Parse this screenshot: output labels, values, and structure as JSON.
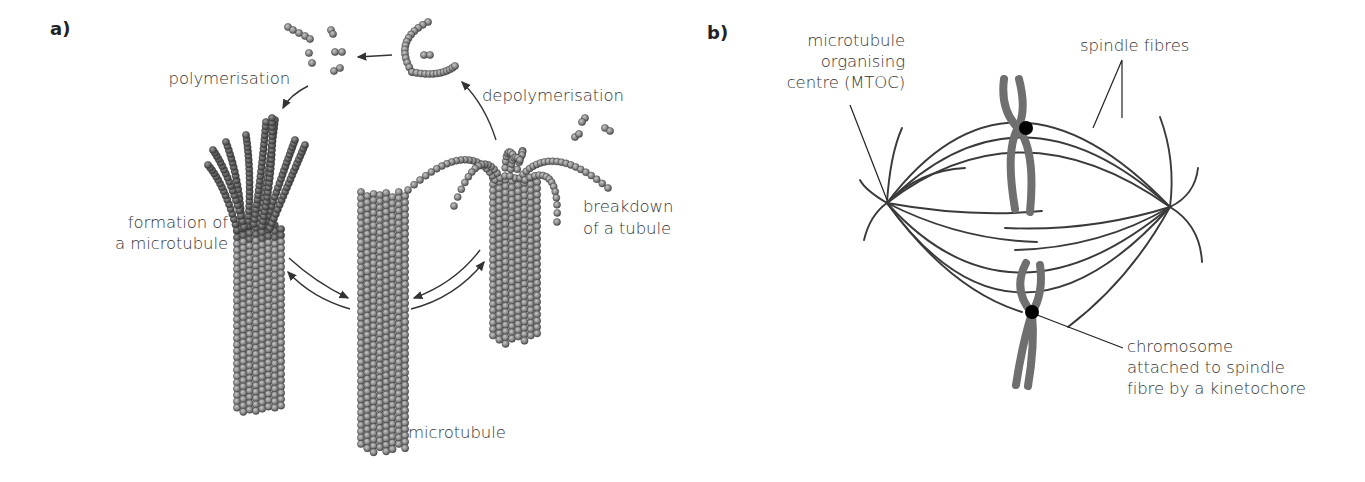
{
  "figure": {
    "panel_a": {
      "letter": "a)",
      "labels": {
        "polymerisation": "polymerisation",
        "depolymerisation": "depolymerisation",
        "formation_line1": "formation of",
        "formation_line2": "a microtubule",
        "breakdown_line1": "breakdown",
        "breakdown_line2": "of a tubule",
        "microtubule": "microtubule"
      }
    },
    "panel_b": {
      "letter": "b)",
      "labels": {
        "mtoc_line1": "microtubule",
        "mtoc_line2": "organising",
        "mtoc_line3": "centre (MTOC)",
        "spindle_fibres": "spindle fibres",
        "chromosome_line1": "chromosome",
        "chromosome_line2": "attached to spindle",
        "chromosome_line3": "fibre by a kinetochore"
      }
    },
    "colors": {
      "bead_fill": "#8a8a8a",
      "bead_dark": "#5a5a5a",
      "bead_stroke": "#3a3a3a",
      "line": "#333333",
      "chromosome": "#6e6e6e",
      "kinetochore": "#000000"
    }
  }
}
